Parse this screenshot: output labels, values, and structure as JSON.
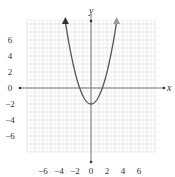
{
  "chart_data": {
    "type": "line",
    "title": "",
    "function": "y = x^2 - 2",
    "xlabel": "x",
    "ylabel": "y",
    "xlim": [
      -8,
      8
    ],
    "ylim": [
      -8,
      8.5
    ],
    "grid": true,
    "x_ticks": [
      "−6",
      "−4",
      "−2",
      "0",
      "2",
      "4",
      "6"
    ],
    "x_tick_values": [
      -6,
      -4,
      -2,
      0,
      2,
      4,
      6
    ],
    "y_ticks": [
      "6",
      "4",
      "2",
      "0",
      "−2",
      "−4",
      "−6"
    ],
    "y_tick_values": [
      6,
      4,
      2,
      0,
      -2,
      -4,
      -6
    ],
    "series": [
      {
        "name": "parabola",
        "x": [
          -3.2,
          -3,
          -2.5,
          -2,
          -1.5,
          -1.414,
          -1,
          -0.5,
          0,
          0.5,
          1,
          1.414,
          1.5,
          2,
          2.5,
          3,
          3.2
        ],
        "y": [
          8.24,
          7,
          4.25,
          2,
          0.25,
          0,
          -1,
          -1.75,
          -2,
          -1.75,
          -1,
          0,
          0.25,
          2,
          4.25,
          7,
          8.24
        ]
      }
    ],
    "vertex": [
      0,
      -2
    ],
    "x_intercepts": [
      -1.414,
      1.414
    ],
    "colors": {
      "curve": "#555555",
      "left_arrow": "#333333",
      "right_arrow": "#999999",
      "axes": "#777777",
      "grid": "#dddddd"
    }
  }
}
